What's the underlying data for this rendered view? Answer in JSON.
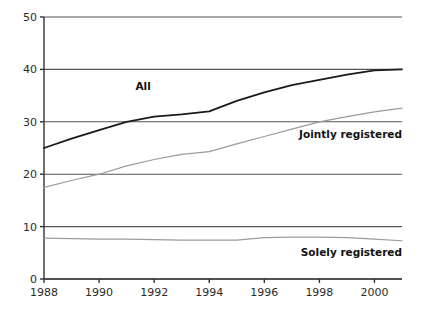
{
  "chart_data": {
    "type": "line",
    "title": "",
    "subtitle": "",
    "xlabel": "",
    "ylabel": "",
    "xlim": [
      1988,
      2001
    ],
    "ylim": [
      0,
      50
    ],
    "grid": true,
    "legend_position": "inline-annotations",
    "x": [
      1988,
      1989,
      1990,
      1991,
      1992,
      1993,
      1994,
      1995,
      1996,
      1997,
      1998,
      1999,
      2000,
      2001
    ],
    "x_tick_labels": [
      "1988",
      "1990",
      "1992",
      "1994",
      "1996",
      "1998",
      "2000"
    ],
    "x_ticks": [
      1988,
      1990,
      1992,
      1994,
      1996,
      1998,
      2000
    ],
    "y_ticks": [
      0,
      10,
      20,
      30,
      40,
      50
    ],
    "y_tick_labels": [
      "0",
      "10",
      "20",
      "30",
      "40",
      "50"
    ],
    "series": [
      {
        "name": "All",
        "color": "#1a1a1a",
        "width": 1.8,
        "values": [
          25.0,
          26.8,
          28.4,
          30.0,
          31.0,
          31.4,
          32.0,
          34.0,
          35.6,
          37.0,
          38.0,
          39.0,
          39.8,
          40.0
        ]
      },
      {
        "name": "Jointly registered",
        "color": "#9a9a9a",
        "width": 1.2,
        "values": [
          17.5,
          18.8,
          20.0,
          21.6,
          22.8,
          23.8,
          24.3,
          25.8,
          27.2,
          28.6,
          30.0,
          31.0,
          31.9,
          32.6
        ]
      },
      {
        "name": "Solely registered",
        "color": "#9a9a9a",
        "width": 1.2,
        "values": [
          7.8,
          7.7,
          7.6,
          7.6,
          7.5,
          7.4,
          7.4,
          7.4,
          7.9,
          8.0,
          8.0,
          7.9,
          7.6,
          7.3
        ]
      }
    ],
    "annotations": [
      {
        "name": "All",
        "text": "All",
        "x": 1991.6,
        "y": 36.0
      },
      {
        "name": "Jointly registered",
        "text": "Jointly  registered",
        "x": 2001.0,
        "y": 27.0
      },
      {
        "name": "Solely registered",
        "text": "Solely registered",
        "x": 2001.0,
        "y": 4.4
      }
    ],
    "colors": {
      "axis": "#333333",
      "grid": "#555555",
      "background": "#ffffff",
      "text": "#2b2b2b",
      "series_all": "#1a1a1a",
      "series_light": "#9a9a9a"
    }
  }
}
